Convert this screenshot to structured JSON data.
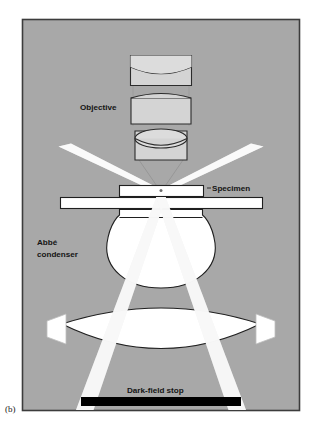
{
  "figure": {
    "panel_label": "(b)",
    "caption_labels": {
      "objective": "Objective",
      "specimen": "Specimen",
      "condenser_line1": "Abbé",
      "condenser_line2": "condenser",
      "darkfield_stop": "Dark-field stop"
    },
    "colors": {
      "panel_background": "#a8a8a8",
      "panel_border": "#3c3c3c",
      "glass_fill": "#d4d4d4",
      "glass_outline": "#2b2b2b",
      "lens_white": "#ffffff",
      "light_beam": "#f2f2f2",
      "stop_black": "#000000",
      "page_background": "#ffffff",
      "text": "#141414"
    },
    "elements": {
      "objective_lens_1": "upper objective doublet",
      "objective_lens_2": "middle objective element",
      "objective_lens_3": "objective front lens",
      "slide": "microscope slide",
      "coverslip": "coverslip over specimen",
      "condenser_upper_lens": "Abbé condenser upper lens",
      "condenser_lower_lens": "Abbé condenser lower lens",
      "dark_field_stop_bar": "opaque central dark-field stop",
      "beam_left_upper": "scattered ray exiting upper left",
      "beam_right_upper": "scattered ray exiting upper right",
      "beam_left_lower": "hollow illumination cone left leg",
      "beam_right_lower": "hollow illumination cone right leg"
    }
  }
}
